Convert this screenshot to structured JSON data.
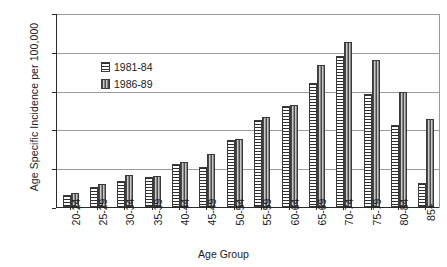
{
  "chart_data": {
    "type": "bar",
    "title": "",
    "xlabel": "Age Group",
    "ylabel": "Age Specific Incidence per 100,000",
    "categories": [
      "20-24",
      "25-29",
      "30-34",
      "35-39",
      "40-44",
      "45-49",
      "50-54",
      "55-59",
      "60-64",
      "65-69",
      "70-74",
      "75-79",
      "80-84",
      "85+"
    ],
    "series": [
      {
        "name": "1981-84",
        "pattern": "horizontal-stripes",
        "values": [
          1.6,
          2.6,
          3.4,
          3.9,
          5.6,
          5.2,
          8.7,
          11.2,
          13.0,
          16.0,
          19.5,
          14.6,
          10.6,
          3.1
        ]
      },
      {
        "name": "1986-89",
        "pattern": "vertical-stripes",
        "values": [
          1.8,
          3.0,
          4.1,
          4.0,
          5.8,
          6.8,
          8.8,
          11.6,
          13.2,
          18.3,
          21.3,
          19.0,
          14.8,
          11.4
        ]
      }
    ],
    "ylim": [
      0,
      25
    ],
    "yticks": [
      0,
      5,
      10,
      15,
      20,
      25
    ],
    "grid": true,
    "legend_position": "inside-upper-left"
  },
  "legend": {
    "items": [
      {
        "label": "1981-84"
      },
      {
        "label": "1986-89"
      }
    ]
  }
}
